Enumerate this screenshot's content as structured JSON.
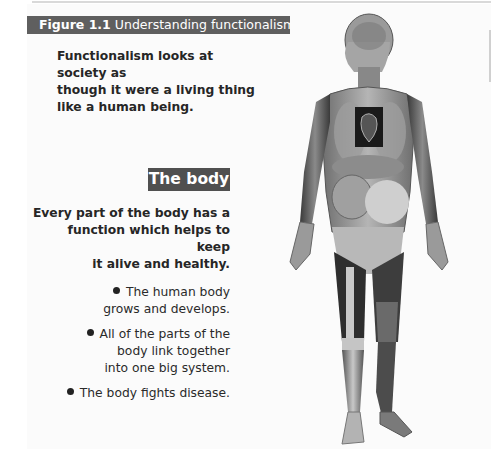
{
  "figure": {
    "number": "Figure 1.1",
    "title": "Understanding functionalism"
  },
  "intro": {
    "lines": [
      "Functionalism looks at society as",
      "though it were a living thing",
      "like a human being."
    ]
  },
  "section": {
    "badge": "The body",
    "description_lines": [
      "Every part of the body has a",
      "function which helps to keep",
      "it alive and healthy."
    ]
  },
  "bullets": [
    {
      "lines": [
        "The human body",
        "grows and develops."
      ]
    },
    {
      "lines": [
        "All of the parts of the",
        "body link together",
        "into one big system."
      ]
    },
    {
      "lines": [
        "The body fights disease."
      ]
    }
  ],
  "illustration": {
    "icon": "anatomical-human-body-icon",
    "description": "Anatomical human figure showing circulatory system, heart, organs, muscles and bones"
  },
  "colors": {
    "header_bg": "#5f5f5f",
    "badge_bg": "#505050",
    "text": "#262626"
  }
}
